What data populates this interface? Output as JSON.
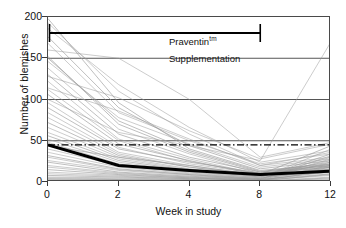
{
  "chart_data": {
    "type": "line",
    "title": "",
    "subtitle": "",
    "xlabel": "Week in study",
    "ylabel": "Number of blemishes",
    "x": [
      0,
      2,
      4,
      8,
      12
    ],
    "xtick_labels": [
      "0",
      "2",
      "4",
      "8",
      "12"
    ],
    "ytick_labels": [
      "0",
      "50",
      "100",
      "150",
      "200"
    ],
    "yticks": [
      0,
      50,
      100,
      150,
      200
    ],
    "ylim": [
      0,
      200
    ],
    "xlim_categorical": true,
    "grid": "horizontal-major",
    "legend": "none",
    "series": [
      {
        "name": "Mean",
        "style": "thick-black",
        "color": "#000000",
        "values": [
          45,
          20,
          14,
          9,
          13
        ]
      },
      {
        "name": "Baseline reference",
        "style": "dash-dot-horizontal",
        "color": "#000000",
        "values": [
          45,
          45,
          45,
          45,
          45
        ]
      },
      {
        "name": "Subject 1",
        "style": "thin-grey",
        "values": [
          198,
          96,
          40,
          14,
          22
        ]
      },
      {
        "name": "Subject 2",
        "style": "thin-grey",
        "values": [
          193,
          110,
          58,
          20,
          30
        ]
      },
      {
        "name": "Subject 3",
        "style": "thin-grey",
        "values": [
          186,
          118,
          66,
          24,
          38
        ]
      },
      {
        "name": "Subject 4",
        "style": "thin-grey",
        "values": [
          176,
          90,
          44,
          16,
          26
        ]
      },
      {
        "name": "Subject 5",
        "style": "thin-grey",
        "values": [
          168,
          84,
          50,
          22,
          34
        ]
      },
      {
        "name": "Subject 6",
        "style": "thin-grey",
        "values": [
          160,
          150,
          100,
          30,
          48
        ]
      },
      {
        "name": "Subject 7",
        "style": "thin-grey",
        "values": [
          152,
          70,
          36,
          12,
          20
        ]
      },
      {
        "name": "Subject 8",
        "style": "thin-grey",
        "values": [
          146,
          78,
          46,
          18,
          28
        ]
      },
      {
        "name": "Subject 9",
        "style": "thin-grey",
        "values": [
          138,
          64,
          34,
          10,
          18
        ]
      },
      {
        "name": "Subject 10",
        "style": "thin-grey",
        "values": [
          130,
          58,
          30,
          12,
          24
        ]
      },
      {
        "name": "Subject 11",
        "style": "thin-grey",
        "values": [
          122,
          52,
          28,
          9,
          16
        ]
      },
      {
        "name": "Subject 12",
        "style": "thin-grey",
        "values": [
          114,
          86,
          52,
          20,
          36
        ]
      },
      {
        "name": "Subject 13",
        "style": "thin-grey",
        "values": [
          106,
          46,
          26,
          8,
          15
        ]
      },
      {
        "name": "Subject 14",
        "style": "thin-grey",
        "values": [
          100,
          60,
          44,
          26,
          170
        ]
      },
      {
        "name": "Subject 15",
        "style": "thin-grey",
        "values": [
          96,
          42,
          22,
          10,
          18
        ]
      },
      {
        "name": "Subject 16",
        "style": "thin-grey",
        "values": [
          90,
          40,
          24,
          11,
          20
        ]
      },
      {
        "name": "Subject 17",
        "style": "thin-grey",
        "values": [
          84,
          36,
          20,
          8,
          14
        ]
      },
      {
        "name": "Subject 18",
        "style": "thin-grey",
        "values": [
          78,
          34,
          18,
          7,
          30
        ]
      },
      {
        "name": "Subject 19",
        "style": "thin-grey",
        "values": [
          72,
          32,
          18,
          9,
          44
        ]
      },
      {
        "name": "Subject 20",
        "style": "thin-grey",
        "values": [
          66,
          30,
          16,
          6,
          12
        ]
      },
      {
        "name": "Subject 21",
        "style": "thin-grey",
        "values": [
          60,
          28,
          15,
          7,
          26
        ]
      },
      {
        "name": "Subject 22",
        "style": "thin-grey",
        "values": [
          56,
          26,
          14,
          6,
          34
        ]
      },
      {
        "name": "Subject 23",
        "style": "thin-grey",
        "values": [
          52,
          24,
          13,
          5,
          18
        ]
      },
      {
        "name": "Subject 24",
        "style": "thin-grey",
        "values": [
          48,
          22,
          12,
          5,
          40
        ]
      },
      {
        "name": "Subject 25",
        "style": "thin-grey",
        "values": [
          44,
          30,
          20,
          8,
          22
        ]
      },
      {
        "name": "Subject 26",
        "style": "thin-grey",
        "values": [
          40,
          20,
          11,
          4,
          16
        ]
      },
      {
        "name": "Subject 27",
        "style": "thin-grey",
        "values": [
          36,
          18,
          10,
          4,
          28
        ]
      },
      {
        "name": "Subject 28",
        "style": "thin-grey",
        "values": [
          32,
          16,
          9,
          3,
          12
        ]
      },
      {
        "name": "Subject 29",
        "style": "thin-grey",
        "values": [
          30,
          15,
          9,
          4,
          24
        ]
      },
      {
        "name": "Subject 30",
        "style": "thin-grey",
        "values": [
          26,
          14,
          8,
          3,
          10
        ]
      },
      {
        "name": "Subject 31",
        "style": "thin-grey",
        "values": [
          24,
          12,
          7,
          3,
          20
        ]
      },
      {
        "name": "Subject 32",
        "style": "thin-grey",
        "values": [
          20,
          11,
          6,
          2,
          14
        ]
      },
      {
        "name": "Subject 33",
        "style": "thin-grey",
        "values": [
          18,
          10,
          6,
          3,
          32
        ]
      },
      {
        "name": "Subject 34",
        "style": "thin-grey",
        "values": [
          15,
          9,
          5,
          2,
          9
        ]
      },
      {
        "name": "Subject 35",
        "style": "thin-grey",
        "values": [
          12,
          8,
          5,
          2,
          18
        ]
      },
      {
        "name": "Subject 36",
        "style": "thin-grey",
        "values": [
          10,
          7,
          4,
          2,
          8
        ]
      },
      {
        "name": "Subject 37",
        "style": "thin-grey",
        "values": [
          8,
          6,
          4,
          2,
          14
        ]
      },
      {
        "name": "Subject 38",
        "style": "thin-grey",
        "values": [
          6,
          5,
          3,
          1,
          6
        ]
      },
      {
        "name": "Subject 39",
        "style": "thin-grey",
        "values": [
          5,
          4,
          3,
          1,
          10
        ]
      },
      {
        "name": "Subject 40",
        "style": "thin-grey",
        "values": [
          4,
          3,
          2,
          1,
          5
        ]
      },
      {
        "name": "Subject 41",
        "style": "thin-grey",
        "values": [
          3,
          3,
          2,
          1,
          4
        ]
      },
      {
        "name": "Subject 42",
        "style": "thin-grey",
        "values": [
          2,
          2,
          1,
          1,
          3
        ]
      },
      {
        "name": "Subject 43",
        "style": "thin-grey",
        "values": [
          150,
          74,
          38,
          13,
          21
        ]
      },
      {
        "name": "Subject 44",
        "style": "thin-grey",
        "values": [
          128,
          102,
          62,
          28,
          46
        ]
      },
      {
        "name": "Subject 45",
        "style": "thin-grey",
        "values": [
          112,
          50,
          25,
          10,
          19
        ]
      }
    ],
    "annotations": [
      {
        "id": "praventin",
        "text": "Praventin",
        "superscript": "tm",
        "position": "top-inside"
      },
      {
        "id": "supplementation",
        "text": "Supplementation",
        "position": "top-inside"
      },
      {
        "id": "supplementation-bar",
        "type": "range-bar-with-endcaps",
        "x_start": 0,
        "x_end": 8,
        "color": "#000000"
      }
    ]
  },
  "axes": {
    "y_title": "Number of blemishes",
    "x_title": "Week in study",
    "y_tick_labels": [
      "200",
      "150",
      "100",
      "50",
      "0"
    ],
    "x_tick_labels": [
      "0",
      "2",
      "4",
      "8",
      "12"
    ]
  },
  "annotations": {
    "praventin_label": "Praventin",
    "praventin_sup": "tm",
    "supplementation_label": "Supplementation"
  }
}
